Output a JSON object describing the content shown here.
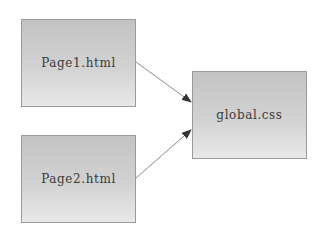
{
  "diagram": {
    "type": "dependency",
    "nodes": [
      {
        "id": "page1",
        "label": "Page1.html"
      },
      {
        "id": "page2",
        "label": "Page2.html"
      },
      {
        "id": "global",
        "label": "global.css"
      }
    ],
    "edges": [
      {
        "from": "page1",
        "to": "global"
      },
      {
        "from": "page2",
        "to": "global"
      }
    ],
    "colors": {
      "box_top": "#c3c3c3",
      "box_bottom": "#e8e8e8",
      "border": "#9a9a9a",
      "arrow": "#8c8c8c",
      "arrowhead": "#333333",
      "text": "#3a3a3a"
    }
  }
}
